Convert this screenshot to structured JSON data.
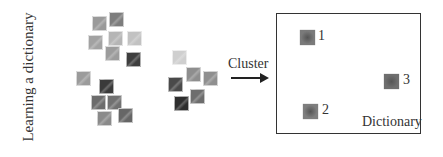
{
  "left_label": "Learning a dictionary",
  "patches": [
    {
      "id": "A",
      "x": 92,
      "y": 16,
      "color": "#9a9a9a"
    },
    {
      "id": "B",
      "x": 109,
      "y": 12,
      "color": "#7d7d7d"
    },
    {
      "id": "C",
      "x": 88,
      "y": 35,
      "color": "#a2a2a2"
    },
    {
      "id": "D",
      "x": 108,
      "y": 31,
      "color": "#b5b5b5"
    },
    {
      "id": "E",
      "x": 127,
      "y": 31,
      "color": "#c2c2c2"
    },
    {
      "id": "F",
      "x": 105,
      "y": 46,
      "color": "#9c9c9c"
    },
    {
      "id": "G",
      "x": 126,
      "y": 52,
      "color": "#3e3e3e"
    },
    {
      "id": "H",
      "x": 76,
      "y": 71,
      "color": "#9b9b9b"
    },
    {
      "id": "I",
      "x": 99,
      "y": 79,
      "color": "#3a3a3a"
    },
    {
      "id": "J",
      "x": 91,
      "y": 95,
      "color": "#6c6c6c"
    },
    {
      "id": "K",
      "x": 107,
      "y": 95,
      "color": "#717171"
    },
    {
      "id": "L",
      "x": 97,
      "y": 111,
      "color": "#8a8a8a"
    },
    {
      "id": "M",
      "x": 118,
      "y": 108,
      "color": "#666666"
    },
    {
      "id": "N",
      "x": 172,
      "y": 50,
      "color": "#cfcfcf"
    },
    {
      "id": "O",
      "x": 186,
      "y": 67,
      "color": "#8e8e8e"
    },
    {
      "id": "P",
      "x": 203,
      "y": 71,
      "color": "#8f8f8f"
    },
    {
      "id": "Q",
      "x": 168,
      "y": 77,
      "color": "#4a4a4a"
    },
    {
      "id": "R",
      "x": 190,
      "y": 89,
      "color": "#6d6d6d"
    },
    {
      "id": "S",
      "x": 174,
      "y": 96,
      "color": "#2e2e2e"
    }
  ],
  "arrow": {
    "label": "Cluster"
  },
  "dictionary": {
    "label": "Dictionary",
    "atoms": [
      {
        "number": "1",
        "x": 23,
        "y": 16,
        "num_x": 41,
        "num_y": 14,
        "color": "#7a7a7a"
      },
      {
        "number": "2",
        "x": 26,
        "y": 90,
        "num_x": 45,
        "num_y": 88,
        "color": "#7e7e7e"
      },
      {
        "number": "3",
        "x": 107,
        "y": 60,
        "num_x": 126,
        "num_y": 58,
        "color": "#6e6e6e"
      }
    ]
  }
}
